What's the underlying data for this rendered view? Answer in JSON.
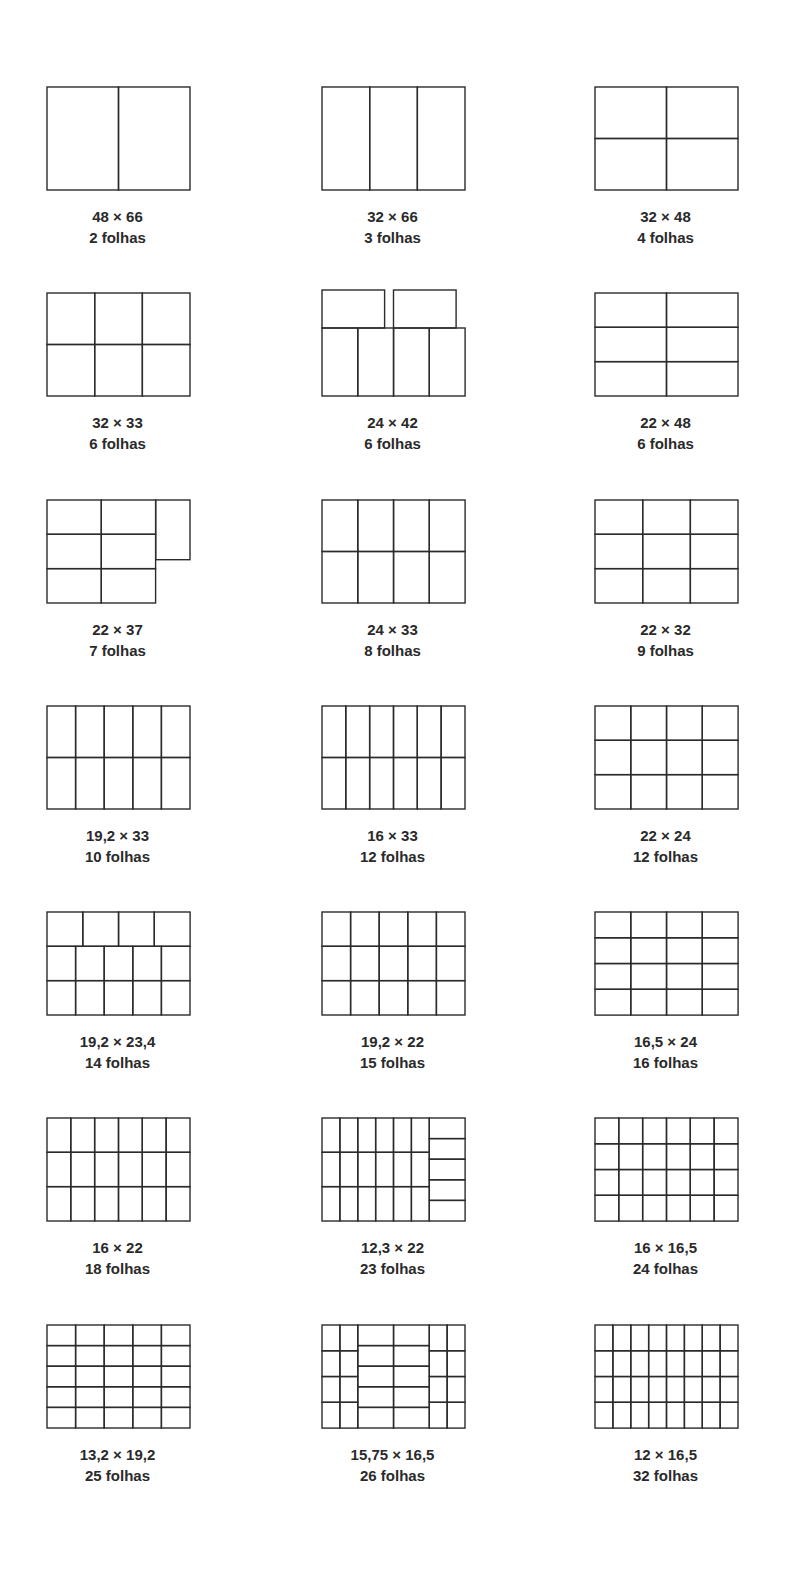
{
  "diagram": {
    "layouts": [
      {
        "size": "48 × 66",
        "sheets": "2 folhas",
        "rects": [
          [
            0,
            0,
            0.5,
            1
          ],
          [
            0.5,
            0,
            0.5,
            1
          ]
        ]
      },
      {
        "size": "32 × 66",
        "sheets": "3 folhas",
        "rects": [
          [
            0,
            0,
            0.3333,
            1
          ],
          [
            0.3333,
            0,
            0.3333,
            1
          ],
          [
            0.6667,
            0,
            0.3333,
            1
          ]
        ]
      },
      {
        "size": "32 × 48",
        "sheets": "4 folhas",
        "rects": [
          [
            0,
            0,
            0.5,
            0.5
          ],
          [
            0.5,
            0,
            0.5,
            0.5
          ],
          [
            0,
            0.5,
            0.5,
            0.5
          ],
          [
            0.5,
            0.5,
            0.5,
            0.5
          ]
        ]
      },
      {
        "size": "32 × 33",
        "sheets": "6 folhas",
        "rects": [
          [
            0,
            0,
            0.3333,
            0.5
          ],
          [
            0.3333,
            0,
            0.3333,
            0.5
          ],
          [
            0.6667,
            0,
            0.3333,
            0.5
          ],
          [
            0,
            0.5,
            0.3333,
            0.5
          ],
          [
            0.3333,
            0.5,
            0.3333,
            0.5
          ],
          [
            0.6667,
            0.5,
            0.3333,
            0.5
          ]
        ]
      },
      {
        "size": "24 × 42",
        "sheets": "6 folhas",
        "rects": [
          [
            0,
            0,
            0.4375,
            0.34
          ],
          [
            0.5,
            0,
            0.4375,
            0.34
          ],
          [
            0,
            0.34,
            0.25,
            0.66
          ],
          [
            0.25,
            0.34,
            0.25,
            0.66
          ],
          [
            0.5,
            0.34,
            0.25,
            0.66
          ],
          [
            0.75,
            0.34,
            0.25,
            0.66
          ]
        ]
      },
      {
        "size": "22 × 48",
        "sheets": "6 folhas",
        "rects": [
          [
            0,
            0,
            0.5,
            0.3333
          ],
          [
            0.5,
            0,
            0.5,
            0.3333
          ],
          [
            0,
            0.3333,
            0.5,
            0.3333
          ],
          [
            0.5,
            0.3333,
            0.5,
            0.3333
          ],
          [
            0,
            0.6667,
            0.5,
            0.3333
          ],
          [
            0.5,
            0.6667,
            0.5,
            0.3333
          ]
        ]
      },
      {
        "size": "22 × 37",
        "sheets": "7 folhas",
        "rects": [
          [
            0,
            0,
            0.38,
            0.3333
          ],
          [
            0.38,
            0,
            0.38,
            0.3333
          ],
          [
            0,
            0.3333,
            0.38,
            0.3333
          ],
          [
            0.38,
            0.3333,
            0.38,
            0.3333
          ],
          [
            0,
            0.6667,
            0.38,
            0.3333
          ],
          [
            0.38,
            0.6667,
            0.38,
            0.3333
          ],
          [
            0.76,
            0,
            0.24,
            0.58
          ]
        ]
      },
      {
        "size": "24 × 33",
        "sheets": "8 folhas",
        "rects": [
          [
            0,
            0,
            0.25,
            0.5
          ],
          [
            0.25,
            0,
            0.25,
            0.5
          ],
          [
            0.5,
            0,
            0.25,
            0.5
          ],
          [
            0.75,
            0,
            0.25,
            0.5
          ],
          [
            0,
            0.5,
            0.25,
            0.5
          ],
          [
            0.25,
            0.5,
            0.25,
            0.5
          ],
          [
            0.5,
            0.5,
            0.25,
            0.5
          ],
          [
            0.75,
            0.5,
            0.25,
            0.5
          ]
        ]
      },
      {
        "size": "22 × 32",
        "sheets": "9 folhas",
        "rects": [
          [
            0,
            0,
            0.3333,
            0.3333
          ],
          [
            0.3333,
            0,
            0.3333,
            0.3333
          ],
          [
            0.6667,
            0,
            0.3333,
            0.3333
          ],
          [
            0,
            0.3333,
            0.3333,
            0.3333
          ],
          [
            0.3333,
            0.3333,
            0.3333,
            0.3333
          ],
          [
            0.6667,
            0.3333,
            0.3333,
            0.3333
          ],
          [
            0,
            0.6667,
            0.3333,
            0.3333
          ],
          [
            0.3333,
            0.6667,
            0.3333,
            0.3333
          ],
          [
            0.6667,
            0.6667,
            0.3333,
            0.3333
          ]
        ]
      },
      {
        "size": "19,2 × 33",
        "sheets": "10 folhas",
        "grid": [
          5,
          2
        ]
      },
      {
        "size": "16 × 33",
        "sheets": "12 folhas",
        "grid": [
          6,
          2
        ]
      },
      {
        "size": "22 × 24",
        "sheets": "12 folhas",
        "grid": [
          4,
          3
        ]
      },
      {
        "size": "19,2 × 23,4",
        "sheets": "14 folhas",
        "rects": [
          [
            0,
            0,
            0.25,
            0.3333
          ],
          [
            0.25,
            0,
            0.25,
            0.3333
          ],
          [
            0.5,
            0,
            0.25,
            0.3333
          ],
          [
            0.75,
            0,
            0.25,
            0.3333
          ],
          [
            0,
            0.3333,
            0.2,
            0.3333
          ],
          [
            0.2,
            0.3333,
            0.2,
            0.3333
          ],
          [
            0.4,
            0.3333,
            0.2,
            0.3333
          ],
          [
            0.6,
            0.3333,
            0.2,
            0.3333
          ],
          [
            0.8,
            0.3333,
            0.2,
            0.3333
          ],
          [
            0,
            0.6667,
            0.2,
            0.3333
          ],
          [
            0.2,
            0.6667,
            0.2,
            0.3333
          ],
          [
            0.4,
            0.6667,
            0.2,
            0.3333
          ],
          [
            0.6,
            0.6667,
            0.2,
            0.3333
          ],
          [
            0.8,
            0.6667,
            0.2,
            0.3333
          ]
        ]
      },
      {
        "size": "19,2 × 22",
        "sheets": "15 folhas",
        "grid": [
          5,
          3
        ]
      },
      {
        "size": "16,5 × 24",
        "sheets": "16 folhas",
        "grid": [
          4,
          4
        ]
      },
      {
        "size": "16 × 22",
        "sheets": "18 folhas",
        "grid": [
          6,
          3
        ]
      },
      {
        "size": "12,3 × 22",
        "sheets": "23 folhas",
        "rects": [
          [
            0,
            0,
            0.125,
            0.3333
          ],
          [
            0.125,
            0,
            0.125,
            0.3333
          ],
          [
            0.25,
            0,
            0.125,
            0.3333
          ],
          [
            0.375,
            0,
            0.125,
            0.3333
          ],
          [
            0.5,
            0,
            0.125,
            0.3333
          ],
          [
            0.625,
            0,
            0.125,
            0.3333
          ],
          [
            0,
            0.3333,
            0.125,
            0.3333
          ],
          [
            0.125,
            0.3333,
            0.125,
            0.3333
          ],
          [
            0.25,
            0.3333,
            0.125,
            0.3333
          ],
          [
            0.375,
            0.3333,
            0.125,
            0.3333
          ],
          [
            0.5,
            0.3333,
            0.125,
            0.3333
          ],
          [
            0.625,
            0.3333,
            0.125,
            0.3333
          ],
          [
            0,
            0.6667,
            0.125,
            0.3333
          ],
          [
            0.125,
            0.6667,
            0.125,
            0.3333
          ],
          [
            0.25,
            0.6667,
            0.125,
            0.3333
          ],
          [
            0.375,
            0.6667,
            0.125,
            0.3333
          ],
          [
            0.5,
            0.6667,
            0.125,
            0.3333
          ],
          [
            0.625,
            0.6667,
            0.125,
            0.3333
          ],
          [
            0.75,
            0,
            0.25,
            0.2
          ],
          [
            0.75,
            0.2,
            0.25,
            0.2
          ],
          [
            0.75,
            0.4,
            0.25,
            0.2
          ],
          [
            0.75,
            0.6,
            0.25,
            0.2
          ],
          [
            0.75,
            0.8,
            0.25,
            0.2
          ]
        ]
      },
      {
        "size": "16 × 16,5",
        "sheets": "24 folhas",
        "grid": [
          6,
          4
        ]
      },
      {
        "size": "13,2 × 19,2",
        "sheets": "25 folhas",
        "grid": [
          5,
          5
        ]
      },
      {
        "size": "15,75 × 16,5",
        "sheets": "26 folhas",
        "rects": [
          [
            0,
            0,
            0.125,
            0.25
          ],
          [
            0.125,
            0,
            0.125,
            0.25
          ],
          [
            0,
            0.25,
            0.125,
            0.25
          ],
          [
            0.125,
            0.25,
            0.125,
            0.25
          ],
          [
            0,
            0.5,
            0.125,
            0.25
          ],
          [
            0.125,
            0.5,
            0.125,
            0.25
          ],
          [
            0,
            0.75,
            0.125,
            0.25
          ],
          [
            0.125,
            0.75,
            0.125,
            0.25
          ],
          [
            0.25,
            0,
            0.25,
            0.2
          ],
          [
            0.5,
            0,
            0.25,
            0.2
          ],
          [
            0.25,
            0.2,
            0.25,
            0.2
          ],
          [
            0.5,
            0.2,
            0.25,
            0.2
          ],
          [
            0.25,
            0.4,
            0.25,
            0.2
          ],
          [
            0.5,
            0.4,
            0.25,
            0.2
          ],
          [
            0.25,
            0.6,
            0.25,
            0.2
          ],
          [
            0.5,
            0.6,
            0.25,
            0.2
          ],
          [
            0.25,
            0.8,
            0.25,
            0.2
          ],
          [
            0.5,
            0.8,
            0.25,
            0.2
          ],
          [
            0.75,
            0,
            0.125,
            0.25
          ],
          [
            0.875,
            0,
            0.125,
            0.25
          ],
          [
            0.75,
            0.25,
            0.125,
            0.25
          ],
          [
            0.875,
            0.25,
            0.125,
            0.25
          ],
          [
            0.75,
            0.5,
            0.125,
            0.25
          ],
          [
            0.875,
            0.5,
            0.125,
            0.25
          ],
          [
            0.75,
            0.75,
            0.125,
            0.25
          ],
          [
            0.875,
            0.75,
            0.125,
            0.25
          ]
        ]
      },
      {
        "size": "12 × 16,5",
        "sheets": "32 folhas",
        "grid": [
          8,
          4
        ]
      }
    ],
    "style": {
      "stroke": "#2b2b2b",
      "stroke_width": 1.4,
      "background": "#ffffff"
    }
  }
}
